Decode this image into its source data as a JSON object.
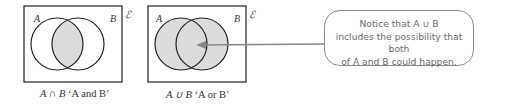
{
  "diagram_left": {
    "set_a_label": "A",
    "set_b_label": "B",
    "universal_label": "ℰ",
    "caption_expr": "A ∩ B",
    "caption_text": "‘A and B’",
    "shaded_region": "intersection",
    "fill_color": "#dcdcdc"
  },
  "diagram_right": {
    "set_a_label": "A",
    "set_b_label": "B",
    "universal_label": "ℰ",
    "caption_expr": "A ∪ B",
    "caption_text": "‘A or B’",
    "shaded_region": "union",
    "fill_color": "#dcdcdc"
  },
  "callout": {
    "line1": "Notice that A ∪ B",
    "line2": "includes the possibility that both",
    "line3": "of A and B could happen."
  }
}
